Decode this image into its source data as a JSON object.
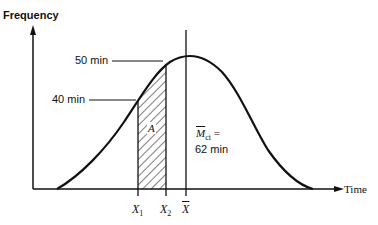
{
  "diagram": {
    "type": "normal-distribution-curve",
    "axes": {
      "y_label": "Frequency",
      "x_label": "Time"
    },
    "annotations": {
      "upper_point": "50 min",
      "lower_point": "40 min",
      "area_label": "A",
      "mean_symbol": "M",
      "mean_subscript": "ct",
      "mean_equals": "=",
      "mean_value": "62 min"
    },
    "x_ticks": [
      {
        "symbol": "X",
        "subscript": "1"
      },
      {
        "symbol": "X",
        "subscript": "2"
      },
      {
        "symbol": "X",
        "subscript": "",
        "overline": true
      }
    ],
    "colors": {
      "line": "#111111",
      "background": "#ffffff"
    }
  }
}
